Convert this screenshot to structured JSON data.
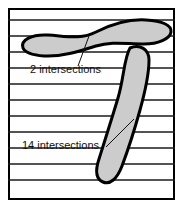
{
  "figure": {
    "frame": {
      "x": 8,
      "y": 8,
      "width": 167,
      "height": 192,
      "border_color": "#000000",
      "fill_color": "#ffffff",
      "border_width": 2
    },
    "grid": {
      "line_color": "#1a1a1a",
      "line_width": 1.6,
      "count": 11,
      "spacing": 16,
      "y_positions": [
        20,
        36,
        52,
        68,
        84,
        100,
        116,
        132,
        148,
        164,
        180
      ],
      "x_start": 8,
      "x_end": 175
    },
    "shapes": [
      {
        "name": "upper-blob",
        "kind": "horizontal-s-curve",
        "fill_color": "#cccccc",
        "stroke_color": "#000000",
        "stroke_width": 3,
        "intersections": 2,
        "path": "M 23 48 C 20 40 32 34 48 35 C 66 36 80 40 96 32 C 112 24 130 19 146 20 C 162 21 172 25 171 32 C 170 39 158 44 144 44 C 126 44 112 41 96 46 C 80 51 62 57 44 56 C 32 55 25 53 23 48 Z"
      },
      {
        "name": "lower-blob",
        "kind": "vertical-sausage",
        "fill_color": "#cccccc",
        "stroke_color": "#000000",
        "stroke_width": 3,
        "intersections": 14,
        "path": "M 130 48 C 140 44 149 49 149 60 C 149 74 145 92 140 110 C 135 128 128 150 122 166 C 117 179 110 185 103 182 C 96 179 95 171 99 159 C 105 140 112 118 118 98 C 124 78 124 58 130 48 Z"
      }
    ],
    "annotations": [
      {
        "name": "upper-annotation",
        "text": "2 intersections",
        "text_x": 30,
        "text_y": 73,
        "leader": {
          "x1": 78,
          "y1": 66,
          "x2": 89,
          "y2": 36
        },
        "leader_color": "#111111",
        "leader_width": 1
      },
      {
        "name": "lower-annotation",
        "text": "14 intersections",
        "text_x": 22,
        "text_y": 149,
        "leader": {
          "x1": 106,
          "y1": 147,
          "x2": 134,
          "y2": 119
        },
        "leader_color": "#111111",
        "leader_width": 1
      }
    ],
    "colors": {
      "shape_fill": "#cccccc",
      "outline": "#000000",
      "grid_line": "#1a1a1a",
      "background": "#ffffff",
      "text": "#111111"
    }
  }
}
